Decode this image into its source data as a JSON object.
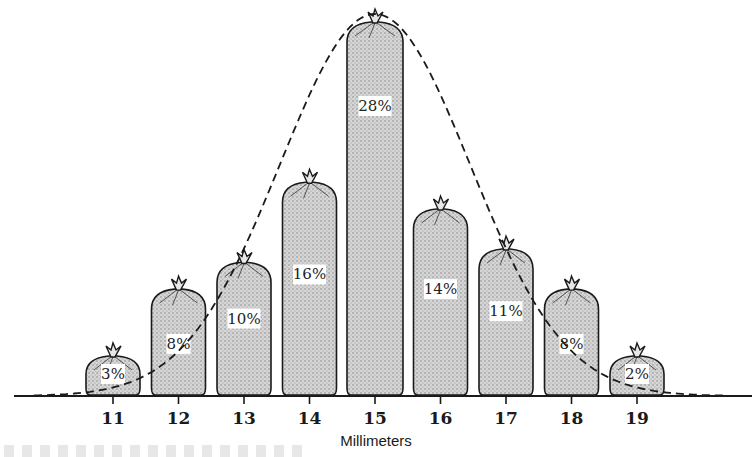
{
  "chart_data": {
    "type": "bar",
    "title": "",
    "xlabel": "Millimeters",
    "ylabel": "",
    "categories": [
      "11",
      "12",
      "13",
      "14",
      "15",
      "16",
      "17",
      "18",
      "19"
    ],
    "values": [
      3,
      8,
      10,
      16,
      28,
      14,
      11,
      8,
      2
    ],
    "value_labels": [
      "3%",
      "8%",
      "10%",
      "16%",
      "28%",
      "14%",
      "11%",
      "8%",
      "2%"
    ],
    "unit": "%",
    "ylim": [
      0,
      30
    ],
    "grid": false,
    "legend": "none",
    "overlay": {
      "type": "line",
      "style": "dashed",
      "description": "bell-shaped normal distribution curve",
      "peak_category": "15"
    },
    "mark_style": "stippled sacks tied at the top"
  },
  "colors": {
    "ink": "#1a1a1a",
    "stipple": "#c8c8c8",
    "background": "#ffffff"
  }
}
